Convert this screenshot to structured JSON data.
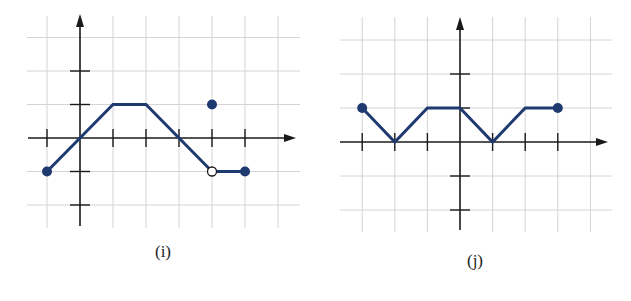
{
  "chart_data": [
    {
      "type": "line",
      "title": "(i)",
      "xlabel": "",
      "ylabel": "",
      "xlim": [
        -1.5,
        6.5
      ],
      "ylim": [
        -2.6,
        3.7
      ],
      "grid": true,
      "x_ticks": [
        -1,
        1,
        2,
        3,
        4,
        5
      ],
      "y_ticks": [
        -2,
        -1,
        1,
        2
      ],
      "segments": [
        {
          "points": [
            [
              -1,
              -1
            ],
            [
              0,
              0
            ],
            [
              1,
              1
            ],
            [
              2,
              1
            ],
            [
              3,
              0
            ],
            [
              4,
              -1
            ]
          ],
          "start": "closed",
          "end": "open"
        },
        {
          "points": [
            [
              4,
              -1
            ],
            [
              5,
              -1
            ]
          ],
          "start": "open",
          "end": "closed"
        }
      ],
      "isolated_points": [
        {
          "x": 4,
          "y": 1,
          "style": "closed"
        }
      ],
      "open_points": [
        {
          "x": 4,
          "y": -1
        }
      ],
      "closed_points": [
        [
          -1,
          -1
        ],
        [
          5,
          -1
        ],
        [
          4,
          1
        ]
      ],
      "color": "#1f3a70"
    },
    {
      "type": "line",
      "title": "(j)",
      "xlabel": "",
      "ylabel": "",
      "xlim": [
        -3.6,
        4.5
      ],
      "ylim": [
        -2.6,
        3.6
      ],
      "grid": true,
      "x_ticks": [
        -3,
        -2,
        -1,
        1,
        2,
        3
      ],
      "y_ticks": [
        -2,
        -1,
        1,
        2
      ],
      "segments": [
        {
          "points": [
            [
              -3,
              1
            ],
            [
              -2,
              0
            ],
            [
              -1,
              1
            ],
            [
              0,
              1
            ],
            [
              1,
              0
            ],
            [
              2,
              1
            ],
            [
              3,
              1
            ]
          ],
          "start": "closed",
          "end": "closed"
        }
      ],
      "isolated_points": [],
      "open_points": [],
      "closed_points": [
        [
          -3,
          1
        ],
        [
          3,
          1
        ]
      ],
      "color": "#1f3a70"
    }
  ],
  "captions": {
    "i": "(i)",
    "j": "(j)"
  },
  "colors": {
    "curve": "#1f3a70",
    "axis": "#1a1a1a",
    "grid": "#d4d4d4"
  }
}
